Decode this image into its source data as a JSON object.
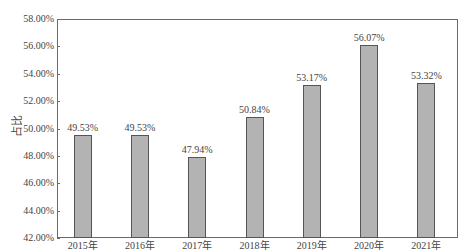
{
  "chart_data": {
    "type": "bar",
    "title": "",
    "xlabel": "",
    "ylabel": "占比",
    "categories": [
      "2015年",
      "2016年",
      "2017年",
      "2018年",
      "2019年",
      "2020年",
      "2021年"
    ],
    "values": [
      49.53,
      49.53,
      47.94,
      50.84,
      53.17,
      56.07,
      53.32
    ],
    "value_labels": [
      "49.53%",
      "49.53%",
      "47.94%",
      "50.84%",
      "53.17%",
      "56.07%",
      "53.32%"
    ],
    "ylim": [
      42,
      58
    ],
    "yticks": [
      42,
      44,
      46,
      48,
      50,
      52,
      54,
      56,
      58
    ],
    "ytick_labels": [
      "42.00%",
      "44.00%",
      "46.00%",
      "48.00%",
      "50.00%",
      "52.00%",
      "54.00%",
      "56.00%",
      "58.00%"
    ],
    "grid": false,
    "legend": null,
    "bar_color": "#b3b3b3",
    "bar_edge_color": "#555555"
  }
}
